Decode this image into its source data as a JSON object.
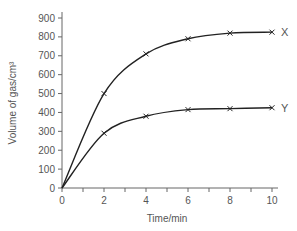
{
  "chart_data": {
    "type": "line",
    "title": "",
    "xlabel": "Time/min",
    "ylabel": "Volume of gas/cm³",
    "xlim": [
      0,
      10
    ],
    "ylim": [
      0,
      900
    ],
    "x_ticks": [
      0,
      2,
      4,
      6,
      8,
      10
    ],
    "y_ticks": [
      0,
      100,
      200,
      300,
      400,
      500,
      600,
      700,
      800,
      900
    ],
    "grid": false,
    "legend": "inline labels at line ends",
    "x": [
      0,
      2,
      4,
      6,
      8,
      10
    ],
    "series": [
      {
        "name": "X",
        "values": [
          0,
          500,
          710,
          790,
          820,
          825
        ]
      },
      {
        "name": "Y",
        "values": [
          0,
          290,
          380,
          415,
          420,
          425
        ]
      }
    ],
    "colors": {
      "line": "#222222",
      "axis": "#666666",
      "text": "#555555"
    }
  }
}
